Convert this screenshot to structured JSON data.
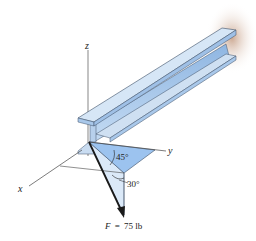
{
  "figure": {
    "axes": {
      "x_label": "x",
      "y_label": "y",
      "z_label": "z"
    },
    "angles": {
      "horizontal_angle": "45°",
      "vertical_angle": "30°"
    },
    "force": {
      "symbol": "F",
      "equals": "=",
      "value": "75 lb",
      "full_label": "F = 75 lb"
    },
    "object": "I-beam",
    "colors": {
      "beam_light": "#cfe0f2",
      "beam_mid": "#a9c8ea",
      "beam_dark": "#7fa9d8",
      "beam_edge": "#3d4f66",
      "plane_fill": "#9cc3ef",
      "vertical_plane_fill": "#dbe9f8",
      "arrow": "#1a1a1a",
      "axis": "#444444",
      "wall_shadow": "#c9a98f"
    }
  }
}
